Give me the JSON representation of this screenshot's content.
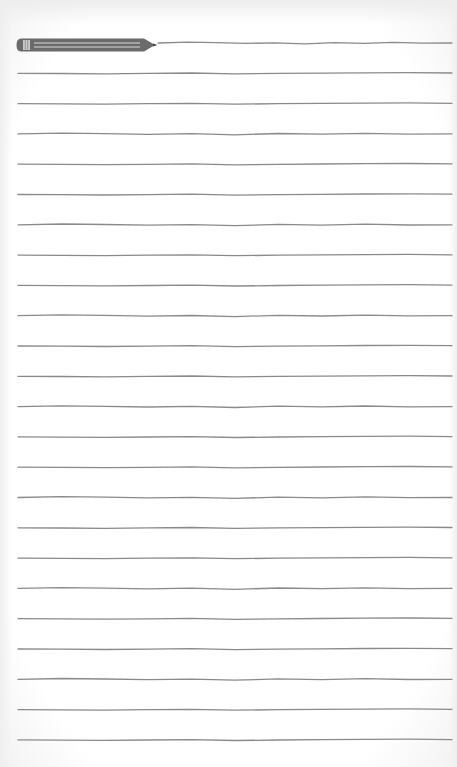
{
  "document": {
    "type": "lined-notepad",
    "background_color": "#ffffff",
    "line_color": "#8a8a8a",
    "line_count": 24,
    "first_line_y": 43,
    "line_spacing": 30.3,
    "line_start_x": 18,
    "line_end_x": 452,
    "lines_text": [
      "",
      "",
      "",
      "",
      "",
      "",
      "",
      "",
      "",
      "",
      "",
      "",
      "",
      "",
      "",
      "",
      "",
      "",
      "",
      "",
      "",
      "",
      "",
      ""
    ]
  },
  "pencil": {
    "icon": "pencil-icon",
    "body_color": "#6b6b6b",
    "stripe_color": "#d9d9d9",
    "ferrule_color": "#c8c8c8"
  }
}
